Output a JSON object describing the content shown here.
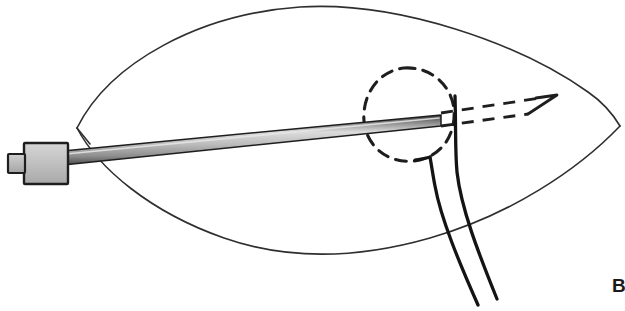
{
  "figure": {
    "panel_label": "B",
    "background_color": "#ffffff",
    "ink_color": "#1a1a1a",
    "outline_color": "#2b2b2b",
    "shaft_light_color": "#d8d8d8",
    "shaft_mid_color": "#a8a8a8",
    "shaft_dark_color": "#6e6e6e",
    "hub_fill_color": "#c3c3c3",
    "elements": {
      "tissue_outline": "lens-shaped tissue outline",
      "cannula_hub": "cannula hub block",
      "hub_tip": "hub connector nub",
      "needle_shaft": "shaded needle shaft",
      "target_lesion": "dashed oval target lesion",
      "needle_trajectory": "dashed needle tip trajectory arrow",
      "suture_pair": "paired suture strands",
      "wire_loop": "solid guide wire loop"
    }
  }
}
